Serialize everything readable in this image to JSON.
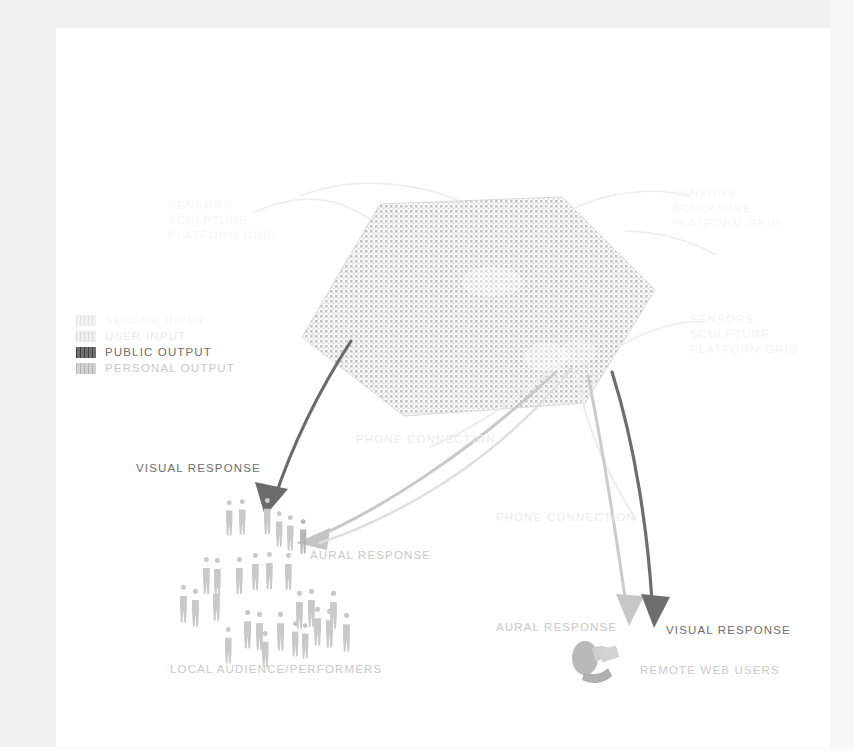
{
  "diagram": {
    "legend": {
      "items": [
        {
          "label": "SENSOR INPUT",
          "swatch": "#eeeeee",
          "pattern": "hatch",
          "tone": "t-ghost"
        },
        {
          "label": "USER INPUT",
          "swatch": "#e6e6e6",
          "pattern": "hatch",
          "tone": "t-faint"
        },
        {
          "label": "PUBLIC OUTPUT",
          "swatch": "#6b6b6b",
          "pattern": "hatch",
          "tone": "t-dark"
        },
        {
          "label": "PERSONAL OUTPUT",
          "swatch": "#c9c9c9",
          "pattern": "hatch",
          "tone": "t-mid"
        }
      ]
    },
    "labels": {
      "sensor_topleft": "SENSORS\nSCULPTURE\nPLATFORM GRID",
      "sensor_topright": "SENSORS\nSCULPTURE\nPLATFORM GRID",
      "sensor_right": "SENSORS\nSCULPTURE\nPLATFORM GRID",
      "phone_connection_1": "PHONE CONNECTION",
      "phone_connection_2": "PHONE CONNECTION",
      "visual_response_left": "VISUAL RESPONSE",
      "aural_response_left": "AURAL RESPONSE",
      "aural_response_right": "AURAL RESPONSE",
      "visual_response_right": "VISUAL RESPONSE",
      "local_audience": "LOCAL AUDIENCE/PERFORMERS",
      "remote_users": "REMOTE WEB USERS"
    },
    "nodes": {
      "hub": {
        "name": "hexagonal-sensor-grid",
        "shape": "hexagon",
        "fill": "#c3c3c3"
      },
      "crowd": {
        "name": "local-audience-crowd",
        "figure_count": 30
      },
      "remote": {
        "name": "remote-web-user",
        "figure": "person-at-laptop"
      }
    },
    "colors": {
      "public_output": "#6b6b6b",
      "personal_output": "#c9c9c9",
      "user_input": "#e6e6e6",
      "sensor_input": "#eeeeee",
      "hub_fill": "#c3c3c3",
      "page_margin": "#f1f1f1"
    }
  }
}
